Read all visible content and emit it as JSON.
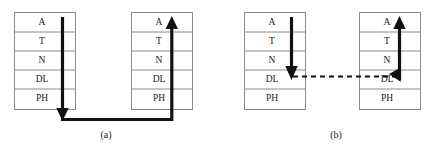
{
  "figure": {
    "background_color": "#ffffff",
    "stroke_color": "#8a8a8a",
    "arrow_color": "#111111"
  },
  "layers": [
    {
      "id": "application",
      "label": "A"
    },
    {
      "id": "transport",
      "label": "T"
    },
    {
      "id": "network",
      "label": "N"
    },
    {
      "id": "data-link",
      "label": "DL"
    },
    {
      "id": "physical",
      "label": "PH"
    }
  ],
  "panels": [
    {
      "id": "panel-a",
      "caption": "(a)",
      "left_stack": {
        "id": "panel-a-left-stack",
        "labels": [
          "A",
          "T",
          "N",
          "DL",
          "PH"
        ]
      },
      "right_stack": {
        "id": "panel-a-right-stack",
        "labels": [
          "A",
          "T",
          "N",
          "DL",
          "PH"
        ]
      },
      "flow": {
        "type": "full-stack-traversal",
        "style": "solid",
        "direction_left": "down",
        "direction_right": "up",
        "connector": "bottom-horizontal"
      }
    },
    {
      "id": "panel-b",
      "caption": "(b)",
      "left_stack": {
        "id": "panel-b-left-stack",
        "labels": [
          "A",
          "T",
          "N",
          "DL",
          "PH"
        ]
      },
      "right_stack": {
        "id": "panel-b-right-stack",
        "labels": [
          "A",
          "T",
          "N",
          "DL",
          "PH"
        ]
      },
      "flow": {
        "type": "data-link-relay",
        "style": "solid-with-dashed-link",
        "direction_left": "down",
        "direction_right": "up",
        "connector": "data-link-dashed-horizontal"
      }
    }
  ]
}
